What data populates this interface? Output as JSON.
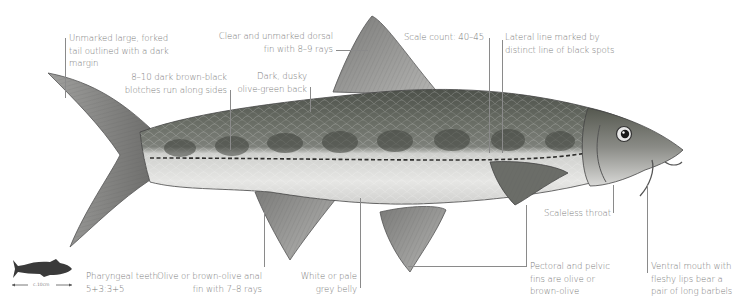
{
  "figure": {
    "palette": {
      "background": "#ffffff",
      "label_text": "#7a7a7a",
      "leader_line": "#8a8a8a",
      "back": "#5e6258",
      "blotch": "#3f423c",
      "belly": "#e4e4e2",
      "fin": "#8c8c8a",
      "silhouette": "#3a3a3a"
    }
  },
  "annotations": {
    "tail": {
      "lines": [
        "Unmarked large, forked",
        "tail outlined with a dark",
        "margin"
      ]
    },
    "blotches": {
      "lines": [
        "8–10 dark brown-black",
        "blotches run along sides"
      ]
    },
    "dorsal_fin": {
      "lines": [
        "Clear and unmarked dorsal",
        "fin with 8–9 rays"
      ]
    },
    "back": {
      "lines": [
        "Dark, dusky",
        "olive-green back"
      ]
    },
    "scale_count": {
      "lines": [
        "Scale count: 40–45"
      ]
    },
    "lateral_line": {
      "lines": [
        "Lateral line marked by",
        "distinct line of black spots"
      ]
    },
    "throat": {
      "lines": [
        "Scaleless throat"
      ]
    },
    "pharyngeal_teeth": {
      "lines": [
        "Pharyngeal teeth:",
        "5+3:3+5"
      ]
    },
    "anal_fin": {
      "lines": [
        "Olive or brown-olive anal",
        "fin with 7–8 rays"
      ]
    },
    "belly": {
      "lines": [
        "White or pale",
        "grey belly"
      ]
    },
    "pectoral_pelvic": {
      "lines": [
        "Pectoral and pelvic",
        "fins are olive or",
        "brown-olive"
      ]
    },
    "mouth": {
      "lines": [
        "Ventral mouth with",
        "fleshy lips bear a",
        "pair of long barbels"
      ]
    }
  },
  "scale_indicator": {
    "icon": "fish-silhouette-icon",
    "label": "c.10cm"
  }
}
